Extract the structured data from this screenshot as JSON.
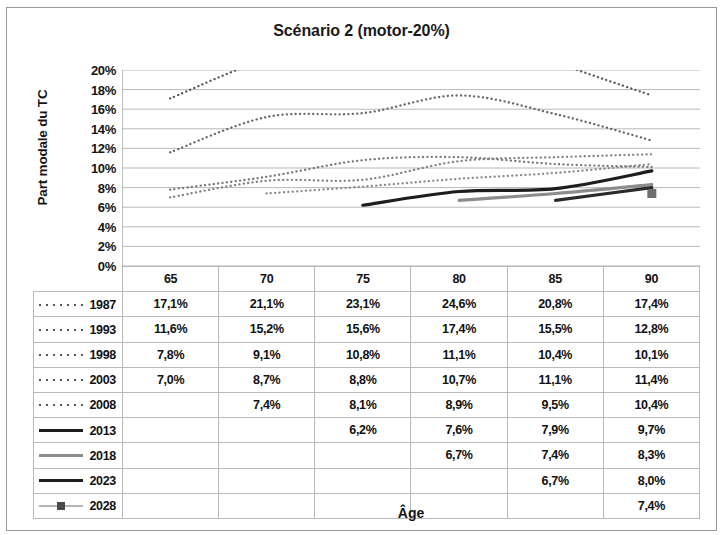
{
  "chart_data": {
    "type": "line",
    "title": "Scénario 2 (motor-20%)",
    "xlabel": "Âge",
    "ylabel": "Part modale du TC",
    "categories": [
      65,
      70,
      75,
      80,
      85,
      90
    ],
    "category_labels": [
      "65",
      "70",
      "75",
      "80",
      "85",
      "90"
    ],
    "ylim": [
      0,
      20
    ],
    "ytick_labels": [
      "20%",
      "18%",
      "16%",
      "14%",
      "12%",
      "10%",
      "8%",
      "6%",
      "4%",
      "2%",
      "0%"
    ],
    "ytick_values": [
      20,
      18,
      16,
      14,
      12,
      10,
      8,
      6,
      4,
      2,
      0
    ],
    "grid": true,
    "legend_position": "table-row-labels",
    "series": [
      {
        "name": "1987",
        "style": "dotted",
        "color": "#555555",
        "values": [
          17.1,
          21.1,
          23.1,
          24.6,
          20.8,
          17.4
        ],
        "value_labels": [
          "17,1%",
          "21,1%",
          "23,1%",
          "24,6%",
          "20,8%",
          "17,4%"
        ]
      },
      {
        "name": "1993",
        "style": "dotted",
        "color": "#666666",
        "values": [
          11.6,
          15.2,
          15.6,
          17.4,
          15.5,
          12.8
        ],
        "value_labels": [
          "11,6%",
          "15,2%",
          "15,6%",
          "17,4%",
          "15,5%",
          "12,8%"
        ]
      },
      {
        "name": "1998",
        "style": "dotted",
        "color": "#777777",
        "values": [
          7.8,
          9.1,
          10.8,
          11.1,
          10.4,
          10.1
        ],
        "value_labels": [
          "7,8%",
          "9,1%",
          "10,8%",
          "11,1%",
          "10,4%",
          "10,1%"
        ]
      },
      {
        "name": "2003",
        "style": "dotted",
        "color": "#808080",
        "values": [
          7.0,
          8.7,
          8.8,
          10.7,
          11.1,
          11.4
        ],
        "value_labels": [
          "7,0%",
          "8,7%",
          "8,8%",
          "10,7%",
          "11,1%",
          "11,4%"
        ]
      },
      {
        "name": "2008",
        "style": "dotted",
        "color": "#8a8a8a",
        "values": [
          null,
          7.4,
          8.1,
          8.9,
          9.5,
          10.4
        ],
        "value_labels": [
          "",
          "7,4%",
          "8,1%",
          "8,9%",
          "9,5%",
          "10,4%"
        ]
      },
      {
        "name": "2013",
        "style": "solid-dark",
        "color": "#1d1d1d",
        "values": [
          null,
          null,
          6.2,
          7.6,
          7.9,
          9.7
        ],
        "value_labels": [
          "",
          "",
          "6,2%",
          "7,6%",
          "7,9%",
          "9,7%"
        ]
      },
      {
        "name": "2018",
        "style": "solid-gray",
        "color": "#8c8c8c",
        "values": [
          null,
          null,
          null,
          6.7,
          7.4,
          8.3
        ],
        "value_labels": [
          "",
          "",
          "",
          "6,7%",
          "7,4%",
          "8,3%"
        ]
      },
      {
        "name": "2023",
        "style": "solid-dark",
        "color": "#2a2a2a",
        "values": [
          null,
          null,
          null,
          null,
          6.7,
          8.0
        ],
        "value_labels": [
          "",
          "",
          "",
          "",
          "6,7%",
          "8,0%"
        ]
      },
      {
        "name": "2028",
        "style": "marker",
        "color": "#b5b5b5",
        "values": [
          null,
          null,
          null,
          null,
          null,
          7.4
        ],
        "value_labels": [
          "",
          "",
          "",
          "",
          "",
          "7,4%"
        ]
      }
    ]
  },
  "table": {
    "column_headers": [
      "",
      "65",
      "70",
      "75",
      "80",
      "85",
      "90"
    ],
    "rows": [
      {
        "label": "1987",
        "key": "dotted",
        "cells": [
          "17,1%",
          "21,1%",
          "23,1%",
          "24,6%",
          "20,8%",
          "17,4%"
        ]
      },
      {
        "label": "1993",
        "key": "dotted",
        "cells": [
          "11,6%",
          "15,2%",
          "15,6%",
          "17,4%",
          "15,5%",
          "12,8%"
        ]
      },
      {
        "label": "1998",
        "key": "dotted",
        "cells": [
          "7,8%",
          "9,1%",
          "10,8%",
          "11,1%",
          "10,4%",
          "10,1%"
        ]
      },
      {
        "label": "2003",
        "key": "dotted",
        "cells": [
          "7,0%",
          "8,7%",
          "8,8%",
          "10,7%",
          "11,1%",
          "11,4%"
        ]
      },
      {
        "label": "2008",
        "key": "dotted",
        "cells": [
          "",
          "7,4%",
          "8,1%",
          "8,9%",
          "9,5%",
          "10,4%"
        ]
      },
      {
        "label": "2013",
        "key": "solid-dark",
        "cells": [
          "",
          "",
          "6,2%",
          "7,6%",
          "7,9%",
          "9,7%"
        ]
      },
      {
        "label": "2018",
        "key": "solid-gray",
        "cells": [
          "",
          "",
          "",
          "6,7%",
          "7,4%",
          "8,3%"
        ]
      },
      {
        "label": "2023",
        "key": "solid-dark",
        "cells": [
          "",
          "",
          "",
          "",
          "6,7%",
          "8,0%"
        ]
      },
      {
        "label": "2028",
        "key": "marker",
        "cells": [
          "",
          "",
          "",
          "",
          "",
          "7,4%"
        ]
      }
    ]
  },
  "colors": {
    "grid": "#b0b0b0",
    "axis": "#8f8f8f",
    "text": "#111111",
    "dark_line": "#1d1d1d",
    "gray_line": "#8c8c8c",
    "light_line": "#b5b5b5"
  }
}
